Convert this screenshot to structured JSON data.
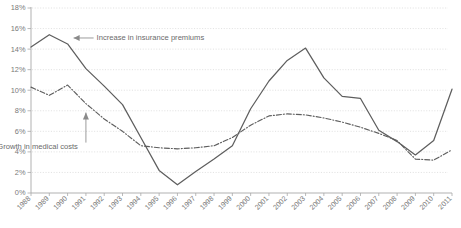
{
  "chart_data": {
    "type": "line",
    "title": "",
    "xlabel": "",
    "ylabel": "",
    "grid": "horizontal-dotted",
    "legend": "inline-annotations",
    "ylim": [
      0,
      18
    ],
    "ytick_suffix": "%",
    "yticks": [
      "0%",
      "2%",
      "4%",
      "6%",
      "8%",
      "10%",
      "12%",
      "14%",
      "16%",
      "18%"
    ],
    "ytick_values": [
      0,
      2,
      4,
      6,
      8,
      10,
      12,
      14,
      16,
      18
    ],
    "categories": [
      "1988",
      "1989",
      "1990",
      "1991",
      "1992",
      "1993",
      "1994",
      "1995",
      "1996",
      "1997",
      "1998",
      "1999",
      "2000",
      "2001",
      "2002",
      "2003",
      "2004",
      "2005",
      "2006",
      "2007",
      "2008",
      "2009",
      "2010",
      "2011"
    ],
    "series": [
      {
        "name": "Increase in insurance premiums",
        "style": "solid",
        "color": "#5e5e5e",
        "values": [
          14.2,
          15.4,
          14.5,
          12.1,
          10.4,
          8.6,
          5.4,
          2.2,
          0.8,
          2.1,
          3.3,
          4.6,
          8.2,
          10.9,
          12.9,
          14.1,
          11.2,
          9.4,
          9.2,
          6.1,
          5.0,
          3.7,
          5.1,
          10.1
        ]
      },
      {
        "name": "Growth in medical costs",
        "style": "dash-dot",
        "color": "#5e5e5e",
        "values": [
          10.3,
          9.5,
          10.5,
          8.7,
          7.2,
          6.0,
          4.6,
          4.4,
          4.3,
          4.4,
          4.6,
          5.4,
          6.6,
          7.5,
          7.7,
          7.6,
          7.3,
          6.9,
          6.4,
          5.8,
          5.1,
          3.3,
          3.2,
          4.2
        ]
      }
    ],
    "annotations": [
      {
        "id": "annot-premiums",
        "text": "Increase in insurance premiums",
        "target_series": "Increase in insurance premiums",
        "target_year": "1990",
        "target_value": 14.5
      },
      {
        "id": "annot-medical",
        "text": "Growth in medical costs",
        "target_series": "Growth in medical costs",
        "target_year": "1991",
        "target_value": 8.7
      }
    ]
  }
}
